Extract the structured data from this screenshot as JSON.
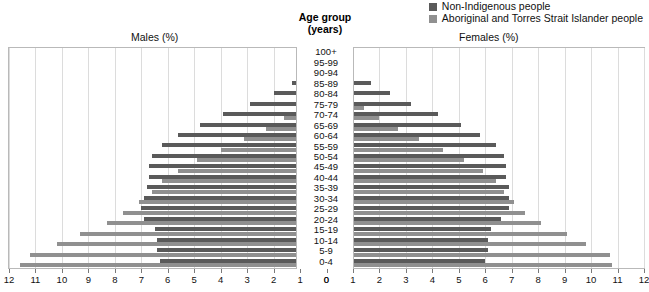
{
  "legend": {
    "items": [
      {
        "label": "Non-Indigenous people",
        "color": "#5a5a5a",
        "name": "legend-non-indigenous"
      },
      {
        "label": "Aboriginal and Torres Strait Islander people",
        "color": "#909090",
        "name": "legend-aboriginal"
      }
    ]
  },
  "headers": {
    "males": "Males (%)",
    "females": "Females (%)",
    "age_line1": "Age group",
    "age_line2": "(years)"
  },
  "chart_data": {
    "type": "bar",
    "subtype": "population-pyramid",
    "title": "",
    "xlabel": "",
    "ylabel": "Age group (years)",
    "left_panel_label": "Males (%)",
    "right_panel_label": "Females (%)",
    "xlim": [
      0,
      12
    ],
    "x_ticks": [
      0,
      1,
      2,
      3,
      4,
      5,
      6,
      7,
      8,
      9,
      10,
      11,
      12
    ],
    "left_tick_labels": [
      "12",
      "11",
      "10",
      "9",
      "8",
      "7",
      "6",
      "5",
      "4",
      "3",
      "2",
      "1",
      "0"
    ],
    "right_tick_labels": [
      "0",
      "1",
      "2",
      "3",
      "4",
      "5",
      "6",
      "7",
      "8",
      "9",
      "10",
      "11",
      "12"
    ],
    "grid": true,
    "legend_position": "top-right",
    "categories": [
      "0-4",
      "5-9",
      "10-14",
      "15-19",
      "20-24",
      "25-29",
      "30-34",
      "35-39",
      "40-44",
      "45-49",
      "50-54",
      "55-59",
      "60-64",
      "65-69",
      "70-74",
      "75-79",
      "80-84",
      "85-89",
      "90-94",
      "95-99",
      "100+"
    ],
    "series": [
      {
        "name": "Non-Indigenous people",
        "color": "#5a5a5a",
        "males": [
          6.3,
          6.4,
          6.4,
          6.5,
          6.9,
          7.0,
          6.9,
          6.8,
          6.7,
          6.7,
          6.6,
          6.2,
          5.6,
          4.8,
          3.9,
          2.9,
          2.0,
          1.3,
          0.7,
          0.2,
          0.05
        ],
        "females": [
          6.0,
          6.1,
          6.1,
          6.2,
          6.6,
          6.9,
          6.9,
          6.9,
          6.8,
          6.8,
          6.7,
          6.4,
          5.8,
          5.1,
          4.2,
          3.2,
          2.4,
          1.7,
          1.0,
          0.35,
          0.08
        ]
      },
      {
        "name": "Aboriginal and Torres Strait Islander people",
        "color": "#909090",
        "males": [
          11.6,
          11.2,
          10.2,
          9.3,
          8.3,
          7.7,
          7.1,
          6.6,
          6.2,
          5.6,
          4.9,
          4.0,
          3.1,
          2.3,
          1.6,
          1.0,
          0.6,
          0.3,
          0.1,
          0.03,
          0.01
        ],
        "females": [
          10.8,
          10.7,
          9.8,
          9.1,
          8.1,
          7.5,
          7.1,
          6.7,
          6.4,
          5.9,
          5.2,
          4.4,
          3.5,
          2.7,
          2.0,
          1.4,
          0.9,
          0.5,
          0.2,
          0.05,
          0.02
        ]
      }
    ]
  }
}
